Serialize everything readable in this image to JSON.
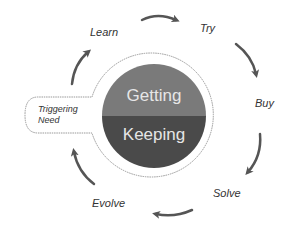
{
  "diagram": {
    "center": {
      "top_label": "Getting",
      "bottom_label": "Keeping",
      "top_color": "#7a7a7a",
      "bottom_color": "#4a4a4a"
    },
    "trigger": {
      "line1": "Triggering",
      "line2": "Need"
    },
    "cycle_stages": [
      {
        "label": "Learn"
      },
      {
        "label": "Try"
      },
      {
        "label": "Buy"
      },
      {
        "label": "Solve"
      },
      {
        "label": "Evolve"
      }
    ],
    "arrow_color": "#555555",
    "ring_color": "#999999"
  }
}
